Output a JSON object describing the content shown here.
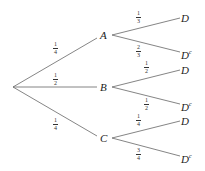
{
  "diagram": {
    "type": "probability-tree",
    "root": {
      "x": 13,
      "y": 87
    },
    "first_level": [
      {
        "label": "A",
        "x": 104,
        "y": 35,
        "prob": {
          "num": "1",
          "den": "4"
        },
        "prob_pos": {
          "x": 53,
          "y": 45
        }
      },
      {
        "label": "B",
        "x": 104,
        "y": 87,
        "prob": {
          "num": "1",
          "den": "2"
        },
        "prob_pos": {
          "x": 53,
          "y": 76
        }
      },
      {
        "label": "C",
        "x": 104,
        "y": 138,
        "prob": {
          "num": "1",
          "den": "4"
        },
        "prob_pos": {
          "x": 53,
          "y": 120
        }
      }
    ],
    "second_level": [
      {
        "parent": "A",
        "label": "D",
        "sup": "",
        "x": 184,
        "y": 18,
        "prob": {
          "num": "1",
          "den": "3"
        },
        "prob_pos": {
          "x": 138,
          "y": 13
        }
      },
      {
        "parent": "A",
        "label": "D",
        "sup": "c",
        "x": 184,
        "y": 52,
        "prob": {
          "num": "2",
          "den": "3"
        },
        "prob_pos": {
          "x": 138,
          "y": 46
        }
      },
      {
        "parent": "B",
        "label": "D",
        "sup": "",
        "x": 184,
        "y": 70,
        "prob": {
          "num": "1",
          "den": "2"
        },
        "prob_pos": {
          "x": 146,
          "y": 63
        }
      },
      {
        "parent": "B",
        "label": "D",
        "sup": "c",
        "x": 184,
        "y": 104,
        "prob": {
          "num": "1",
          "den": "2"
        },
        "prob_pos": {
          "x": 146,
          "y": 98
        }
      },
      {
        "parent": "C",
        "label": "D",
        "sup": "",
        "x": 184,
        "y": 121,
        "prob": {
          "num": "1",
          "den": "4"
        },
        "prob_pos": {
          "x": 138,
          "y": 116
        }
      },
      {
        "parent": "C",
        "label": "D",
        "sup": "c",
        "x": 184,
        "y": 156,
        "prob": {
          "num": "3",
          "den": "4"
        },
        "prob_pos": {
          "x": 138,
          "y": 148
        }
      }
    ],
    "colors": {
      "line": "#555555",
      "text": "#222222"
    }
  }
}
